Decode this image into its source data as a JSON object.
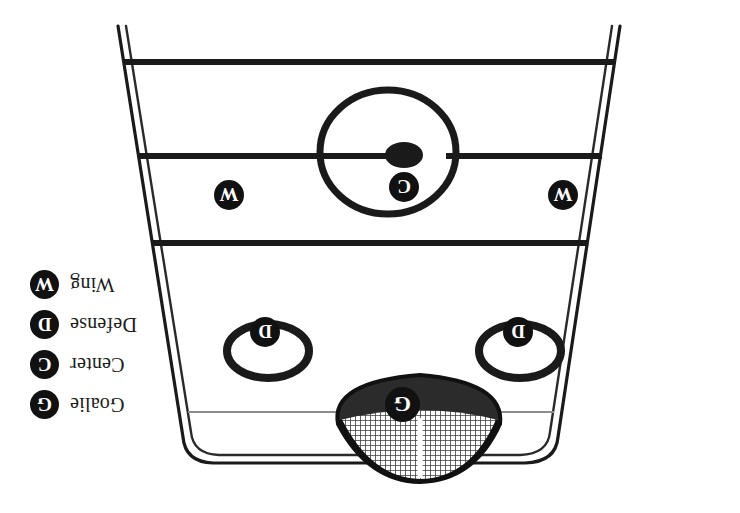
{
  "figure": {
    "kind": "hockey-rink-position-diagram",
    "orientation": "rotated-180",
    "background_color": "#ffffff",
    "ink_color": "#111111",
    "goal_line_color": "#8c8c8c"
  },
  "legend": {
    "rows": [
      {
        "symbol": "G",
        "label": "Goalie"
      },
      {
        "symbol": "C",
        "label": "Center"
      },
      {
        "symbol": "D",
        "label": "Defense"
      },
      {
        "symbol": "W",
        "label": "Wing"
      }
    ]
  },
  "rink": {
    "lines": [
      {
        "name": "far-blue-line"
      },
      {
        "name": "center-red-line"
      },
      {
        "name": "near-blue-line"
      },
      {
        "name": "goal-line"
      }
    ],
    "center_circle": {
      "name": "center-face-off-circle"
    },
    "center_dot": {
      "name": "center-face-off-dot"
    },
    "face_off_circles": [
      {
        "name": "left-face-off-circle"
      },
      {
        "name": "right-face-off-circle"
      }
    ],
    "goal": {
      "name": "goal-net"
    }
  },
  "players": [
    {
      "symbol": "W",
      "role": "Wing",
      "position": "left-wing"
    },
    {
      "symbol": "W",
      "role": "Wing",
      "position": "right-wing"
    },
    {
      "symbol": "C",
      "role": "Center",
      "position": "center-ice"
    },
    {
      "symbol": "D",
      "role": "Defense",
      "position": "left-defense"
    },
    {
      "symbol": "D",
      "role": "Defense",
      "position": "right-defense"
    },
    {
      "symbol": "G",
      "role": "Goalie",
      "position": "goal-crease"
    }
  ]
}
